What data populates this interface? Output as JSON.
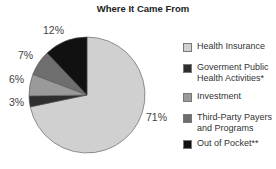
{
  "chart_data": {
    "type": "pie",
    "title": "Where It Came From",
    "categories": [
      "Health Insurance",
      "Goverment Public Health Activities*",
      "Investment",
      "Third-Party Payers and Programs",
      "Out of Pocket**"
    ],
    "values": [
      71,
      3,
      6,
      7,
      12
    ],
    "unit": "%",
    "colors": [
      "#d0d0d0",
      "#2e2e2e",
      "#9a9a9a",
      "#6e6e6e",
      "#111111"
    ],
    "legend_position": "right"
  },
  "title": "Where It Came From",
  "slice_labels": {
    "health_insurance": "71%",
    "government": "3%",
    "investment": "6%",
    "third_party": "7%",
    "out_of_pocket": "12%"
  },
  "legend": {
    "items": [
      {
        "line1": "Health Insurance",
        "line2": "",
        "color": "#d0d0d0"
      },
      {
        "line1": "Goverment Public",
        "line2": "Health Activities*",
        "color": "#2e2e2e"
      },
      {
        "line1": "Investment",
        "line2": "",
        "color": "#9a9a9a"
      },
      {
        "line1": "Third-Party Payers",
        "line2": "and Programs",
        "color": "#6e6e6e"
      },
      {
        "line1": "Out of Pocket**",
        "line2": "",
        "color": "#111111"
      }
    ]
  }
}
